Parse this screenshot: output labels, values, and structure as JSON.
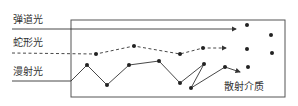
{
  "labels": {
    "ballistic": "弹道光",
    "snake": "蛇形光",
    "diffuse": "漫射光",
    "medium": "散射介质"
  },
  "colors": {
    "stroke": "#333333",
    "box": "#555555"
  }
}
